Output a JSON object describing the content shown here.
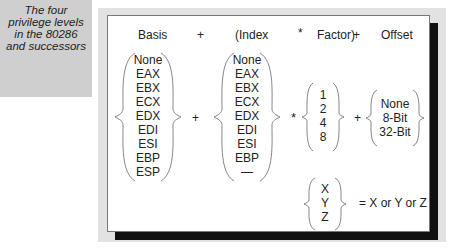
{
  "caption": "The four\nprivilege levels\nin the 80286\nand successors",
  "header": {
    "basis": "Basis",
    "plus1": "+",
    "index": "(Index",
    "times": "*",
    "factor": "Factor)",
    "plus2": "+",
    "offset": "Offset"
  },
  "basis_items": [
    "None",
    "EAX",
    "EBX",
    "ECX",
    "EDX",
    "EDI",
    "ESI",
    "EBP",
    "ESP"
  ],
  "index_items": [
    "None",
    "EAX",
    "EBX",
    "ECX",
    "EDX",
    "EDI",
    "ESI",
    "EBP",
    "—"
  ],
  "factor_items": [
    "1",
    "2",
    "4",
    "8"
  ],
  "offset_items": [
    "None",
    "8-Bit",
    "32-Bit"
  ],
  "legend_items": [
    "X",
    "Y",
    "Z"
  ],
  "operators": {
    "plus_a": "+",
    "star": "*",
    "plus_b": "+"
  },
  "legend_text": "= X or Y or Z"
}
